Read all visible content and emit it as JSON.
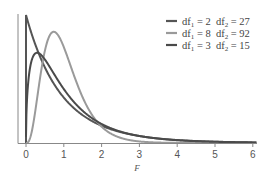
{
  "chart_data": {
    "type": "line",
    "title": "",
    "xlabel": "F",
    "ylabel": "",
    "xlim": [
      0,
      6
    ],
    "ylim": [
      0,
      1.0
    ],
    "x_ticks": [
      "0",
      "1",
      "2",
      "3",
      "4",
      "5",
      "6"
    ],
    "grid": false,
    "legend_position": "top-right",
    "series": [
      {
        "name": "df1 = 2  df2 = 27",
        "df1": 2,
        "df2": 27,
        "color": "#555555",
        "label_parts": [
          "df",
          "1",
          " = 2  df",
          "2",
          " = 27"
        ]
      },
      {
        "name": "df1 = 8  df2 = 92",
        "df1": 8,
        "df2": 92,
        "color": "#9a9a9a",
        "label_parts": [
          "df",
          "1",
          " = 8  df",
          "2",
          " = 92"
        ]
      },
      {
        "name": "df1 = 3  df2 = 15",
        "df1": 3,
        "df2": 15,
        "color": "#4a4a4a",
        "label_parts": [
          "df",
          "1",
          " = 3  df",
          "2",
          " = 15"
        ]
      }
    ]
  }
}
